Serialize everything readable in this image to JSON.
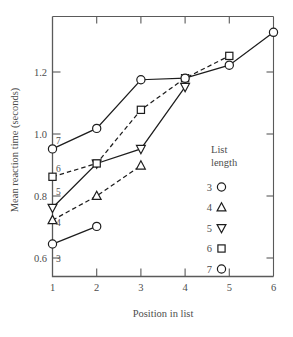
{
  "figure": {
    "name": "mean-reaction-time-by-position-chart",
    "background_color": "#ffffff",
    "ink_color": "#4a4a4a",
    "line_color": "#1d1d1d"
  },
  "axes": {
    "x": {
      "label": "Position in list",
      "ticks": [
        "1",
        "2",
        "3",
        "4",
        "5",
        "6"
      ],
      "min": 1,
      "max": 6
    },
    "y": {
      "label": "Mean reaction time (seconds)",
      "ticks": [
        "0.6",
        "0.8",
        "1.0",
        "1.2"
      ],
      "min": 0.555,
      "max": 1.375
    }
  },
  "legend": {
    "title_line_1": "List",
    "title_line_2": "length",
    "entries": [
      {
        "label": "3",
        "marker": "circle-marker"
      },
      {
        "label": "4",
        "marker": "triangle-up-marker"
      },
      {
        "label": "5",
        "marker": "triangle-down-marker"
      },
      {
        "label": "6",
        "marker": "square-marker"
      },
      {
        "label": "7",
        "marker": "circle-marker"
      }
    ]
  },
  "inline_series_tags": [
    "3",
    "4",
    "5",
    "6",
    "7"
  ],
  "chart_data": {
    "type": "line",
    "title": "",
    "xlabel": "Position in list",
    "ylabel": "Mean reaction time (seconds)",
    "xlim": [
      1,
      6
    ],
    "ylim": [
      0.555,
      1.375
    ],
    "xticks": [
      1,
      2,
      3,
      4,
      5,
      6
    ],
    "yticks": [
      0.6,
      0.8,
      1.0,
      1.2
    ],
    "grid": false,
    "legend_position": "right-inside",
    "legend_title": "List length",
    "series": [
      {
        "name": "3",
        "marker": "circle",
        "linestyle": "solid",
        "x": [
          1,
          2
        ],
        "values": [
          0.645,
          0.702
        ]
      },
      {
        "name": "4",
        "marker": "triangle-up",
        "linestyle": "dashed",
        "x": [
          1,
          2,
          3
        ],
        "values": [
          0.722,
          0.8,
          0.898
        ]
      },
      {
        "name": "5",
        "marker": "triangle-down",
        "linestyle": "solid",
        "x": [
          1,
          2,
          3,
          4
        ],
        "values": [
          0.762,
          0.905,
          0.952,
          1.152
        ]
      },
      {
        "name": "6",
        "marker": "square",
        "linestyle": "dashed",
        "x": [
          1,
          2,
          3,
          4,
          5
        ],
        "values": [
          0.862,
          0.905,
          1.078,
          1.18,
          1.252
        ]
      },
      {
        "name": "7",
        "marker": "circle",
        "linestyle": "solid",
        "x": [
          1,
          2,
          3,
          4,
          5,
          6
        ],
        "values": [
          0.952,
          1.018,
          1.175,
          1.18,
          1.222,
          1.328
        ]
      }
    ]
  }
}
